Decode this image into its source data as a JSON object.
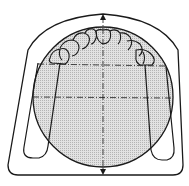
{
  "diagram": {
    "type": "technical line drawing",
    "colors": {
      "stroke": "#1a1a1a",
      "fill_hatch": "#c8c8c8",
      "background": "#ffffff"
    },
    "elements": [
      {
        "name": "tray-outline",
        "shape": "rounded arch outline"
      },
      {
        "name": "reference-circle",
        "shape": "circle",
        "fill": "hatched gray"
      },
      {
        "name": "dental-arch",
        "shape": "row of tooth crowns along top of circle"
      },
      {
        "name": "vertical-axis",
        "shape": "dash-dot line with arrows at both ends"
      },
      {
        "name": "horizontal-axis-upper",
        "shape": "dash-dot line"
      },
      {
        "name": "horizontal-axis-middle",
        "shape": "dash-dot line"
      },
      {
        "name": "left-leg",
        "shape": "elongated U loop"
      },
      {
        "name": "right-leg",
        "shape": "elongated U loop"
      }
    ]
  }
}
